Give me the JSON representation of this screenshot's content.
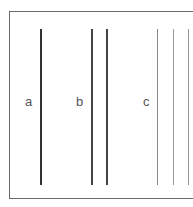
{
  "diagram": {
    "groups": [
      {
        "label": "a",
        "label_x": 25,
        "lines": [
          {
            "x": 41,
            "width": 2,
            "color": "#333333"
          }
        ]
      },
      {
        "label": "b",
        "label_x": 76,
        "lines": [
          {
            "x": 91,
            "width": 1.5,
            "color": "#444444"
          },
          {
            "x": 106,
            "width": 1.5,
            "color": "#444444"
          }
        ]
      },
      {
        "label": "c",
        "label_x": 143,
        "lines": [
          {
            "x": 157,
            "width": 1,
            "color": "#888888"
          },
          {
            "x": 173,
            "width": 1,
            "color": "#999999"
          },
          {
            "x": 188,
            "width": 1,
            "color": "#999999"
          }
        ]
      }
    ]
  }
}
